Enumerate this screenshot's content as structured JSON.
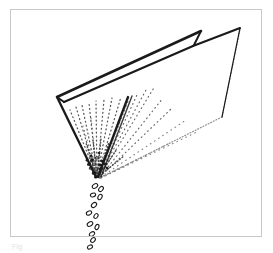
{
  "figure": {
    "domain_label": "line-art-illustration",
    "title": "",
    "caption": "Fig",
    "style": "patent-style black ink line drawing on white",
    "frame": {
      "border_color": "#c9c9cc",
      "fill_color": "#ffffff",
      "x": 10,
      "y": 9,
      "width": 252,
      "height": 228
    },
    "ink_color": "#1a1a1a",
    "stipple_color": "#5a5a5a",
    "faint_line_color": "#8d8d90",
    "parts": [
      {
        "name": "hopper-near-wall",
        "type": "polygon-outline",
        "stroke": "#1a1a1a",
        "stroke_width": 2.2,
        "points": "57,97 128,96 240,28 241,29 129,97 97,176 96,176"
      },
      {
        "name": "hopper-top-rim-near",
        "type": "polyline",
        "stroke": "#1a1a1a",
        "stroke_width": 2.4,
        "points": "57,97 201,31"
      },
      {
        "name": "hopper-top-rim-far",
        "type": "polyline",
        "stroke": "#1a1a1a",
        "stroke_width": 2.2,
        "points": "64,101 128,96"
      },
      {
        "name": "hopper-tab-riser",
        "type": "polyline",
        "stroke": "#1a1a1a",
        "stroke_width": 2.0,
        "points": "201,31 196,42 193,46"
      },
      {
        "name": "hopper-left-edge",
        "type": "polyline",
        "stroke": "#1a1a1a",
        "stroke_width": 2.2,
        "points": "57,97 96,177"
      },
      {
        "name": "hopper-fold-ridge",
        "type": "polyline",
        "stroke": "#1a1a1a",
        "stroke_width": 2.2,
        "points": "129,97 98,176"
      },
      {
        "name": "hopper-right-apex-edge",
        "type": "polyline",
        "stroke": "#1a1a1a",
        "stroke_width": 1.3,
        "points": "240,28 222,117"
      },
      {
        "name": "hopper-far-bottom-edge",
        "type": "dotted-polyline",
        "stroke": "#8d8d90",
        "stroke_width": 1.1,
        "points": "222,117 99,178"
      },
      {
        "name": "hopper-far-rim-edge",
        "type": "dotted-polyline",
        "stroke": "#9a9a9d",
        "stroke_width": 1.0,
        "points": "240,29 222,117"
      },
      {
        "name": "discharge-vertex",
        "type": "node",
        "x": 97,
        "y": 177
      }
    ],
    "stipple": {
      "name": "granular-flow-texture",
      "description": "fan of dotted streak lines converging to the discharge vertex",
      "origin": {
        "x": 97,
        "y": 177
      },
      "ray_count": 16,
      "dot_color": "#4a4a4a",
      "spread_top_left": {
        "x": 72,
        "y": 108
      },
      "spread_top_right": {
        "x": 156,
        "y": 85
      }
    },
    "particles": {
      "name": "discharged-granules",
      "count": 14,
      "fill": "#ffffff",
      "stroke": "#1a1a1a",
      "shape": "ellipse",
      "stream_path": "from (97,177) falling down and slightly left to (92,252)"
    }
  }
}
